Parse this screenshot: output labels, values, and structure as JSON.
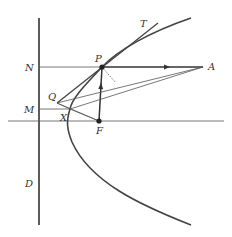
{
  "diagram": {
    "colors": {
      "stroke": "#333333",
      "curve": "#444444",
      "thin": "#555555",
      "background": "#ffffff"
    },
    "labels": {
      "T": "T",
      "P": "P",
      "N": "N",
      "A": "A",
      "Q": "Q",
      "M": "M",
      "X": "X",
      "F": "F",
      "D": "D"
    },
    "points": {
      "P": [
        102,
        67
      ],
      "F": [
        99,
        121
      ],
      "A": [
        203,
        67
      ],
      "Q": [
        57,
        103
      ],
      "X": [
        70,
        109
      ],
      "T_end": [
        158,
        23
      ],
      "N_on_directrix": [
        39,
        67
      ],
      "M_on_directrix": [
        39,
        109
      ]
    },
    "elements": [
      "directrix D (vertical line)",
      "axis (horizontal line through F)",
      "parabola with focus F",
      "tangent line QPT",
      "ray P to A with arrow",
      "ray F to P with arrow",
      "normal at P (dotted)",
      "lines Q-A, X-A, Q-X, X-F",
      "horizontal lines N-P and M-X"
    ]
  }
}
